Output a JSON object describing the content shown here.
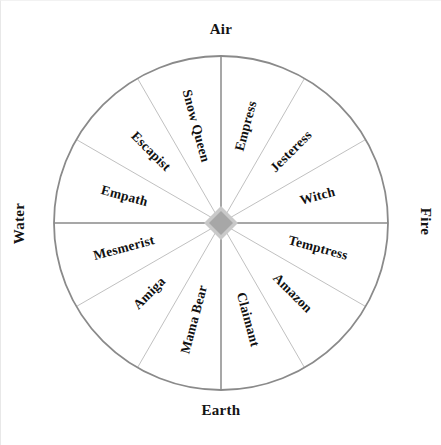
{
  "diagram": {
    "shape": "circle",
    "segment_count": 12,
    "center_ornament": "gray-diamond"
  },
  "colors": {
    "background": "#ffffff",
    "circle_outline": "#8a8a8a",
    "axis_line": "#8a8a8a",
    "spoke_line": "#b9b9b9",
    "center_diamond_fill": "#a7a7a7",
    "center_diamond_stroke": "#c9c9c9",
    "label_text": "#111111",
    "cardinal_text": "#141414"
  },
  "cardinals": {
    "air": "Air",
    "fire": "Fire",
    "earth": "Earth",
    "water": "Water"
  },
  "segments": [
    {
      "label": "Empress",
      "quadrant": "air-fire",
      "angle_deg": 15
    },
    {
      "label": "Jesteress",
      "quadrant": "air-fire",
      "angle_deg": 45
    },
    {
      "label": "Witch",
      "quadrant": "air-fire",
      "angle_deg": 75
    },
    {
      "label": "Temptress",
      "quadrant": "fire-earth",
      "angle_deg": 105
    },
    {
      "label": "Amazon",
      "quadrant": "fire-earth",
      "angle_deg": 135
    },
    {
      "label": "Claimant",
      "quadrant": "fire-earth",
      "angle_deg": 165
    },
    {
      "label": "Mama Bear",
      "quadrant": "earth-water",
      "angle_deg": 195
    },
    {
      "label": "Amiga",
      "quadrant": "earth-water",
      "angle_deg": 225
    },
    {
      "label": "Mesmerist",
      "quadrant": "earth-water",
      "angle_deg": 255
    },
    {
      "label": "Empath",
      "quadrant": "water-air",
      "angle_deg": 285
    },
    {
      "label": "Escapist",
      "quadrant": "water-air",
      "angle_deg": 315
    },
    {
      "label": "Snow Queen",
      "quadrant": "water-air",
      "angle_deg": 345
    }
  ],
  "geometry": {
    "center_x": 220,
    "center_y": 222,
    "radius": 167,
    "center_diamond_half": 17
  }
}
